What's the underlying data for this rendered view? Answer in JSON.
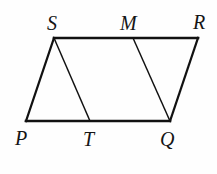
{
  "figure": {
    "background_color": "#fefefe",
    "stroke_color": "#111111",
    "labels": {
      "S": "S",
      "M": "M",
      "R": "R",
      "P": "P",
      "T": "T",
      "Q": "Q"
    },
    "points": {
      "S": {
        "x": 54,
        "y": 38
      },
      "M": {
        "x": 133,
        "y": 38
      },
      "R": {
        "x": 198,
        "y": 38
      },
      "P": {
        "x": 26,
        "y": 121
      },
      "T": {
        "x": 90,
        "y": 121
      },
      "Q": {
        "x": 170,
        "y": 121
      }
    },
    "segments": [
      {
        "name": "side-SR",
        "from": "S",
        "to": "R",
        "width": 2.6
      },
      {
        "name": "side-PQ",
        "from": "P",
        "to": "Q",
        "width": 2.6
      },
      {
        "name": "side-PS",
        "from": "P",
        "to": "S",
        "width": 2.2
      },
      {
        "name": "side-QR",
        "from": "Q",
        "to": "R",
        "width": 2.2
      },
      {
        "name": "segment-ST",
        "from": "S",
        "to": "T",
        "width": 1.5
      },
      {
        "name": "segment-MQ",
        "from": "M",
        "to": "Q",
        "width": 1.5
      }
    ]
  }
}
